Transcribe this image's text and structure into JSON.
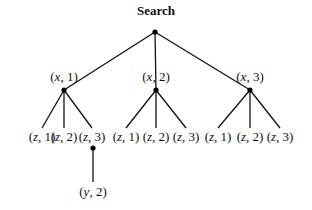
{
  "title": "Search",
  "colors": {
    "line": "#111111",
    "node": "#000000",
    "background": "#ffffff"
  },
  "nodes": {
    "root": {
      "label": "",
      "x": 155,
      "y": 32
    },
    "level1": [
      {
        "label": "(x, 1)",
        "var": "x",
        "val": "1",
        "x": 64,
        "y": 90,
        "labelY": 69
      },
      {
        "label": "(x, 2)",
        "var": "x",
        "val": "2",
        "x": 156,
        "y": 90,
        "labelY": 69
      },
      {
        "label": "(x, 3)",
        "var": "x",
        "val": "3",
        "x": 250,
        "y": 90,
        "labelY": 69
      }
    ],
    "level2": [
      {
        "label": "(z, 1)",
        "var": "z",
        "val": "1",
        "x": 42,
        "parent": 0
      },
      {
        "label": "(z, 2)",
        "var": "z",
        "val": "2",
        "x": 64,
        "parent": 0
      },
      {
        "label": "(z, 3)",
        "var": "z",
        "val": "3",
        "x": 92,
        "parent": 0
      },
      {
        "label": "(z, 1)",
        "var": "z",
        "val": "1",
        "x": 126,
        "parent": 1
      },
      {
        "label": "(z, 2)",
        "var": "z",
        "val": "2",
        "x": 156,
        "parent": 1
      },
      {
        "label": "(z, 3)",
        "var": "z",
        "val": "3",
        "x": 186,
        "parent": 1
      },
      {
        "label": "(z, 1)",
        "var": "z",
        "val": "1",
        "x": 218,
        "parent": 2
      },
      {
        "label": "(z, 2)",
        "var": "z",
        "val": "2",
        "x": 250,
        "parent": 2
      },
      {
        "label": "(z, 3)",
        "var": "z",
        "val": "3",
        "x": 280,
        "parent": 2
      }
    ],
    "level3": [
      {
        "label": "(y, 2)",
        "var": "y",
        "val": "2",
        "x": 93,
        "dotY": 148,
        "labelY": 184,
        "parent": 2
      }
    ]
  },
  "edges": [
    {
      "from": "root",
      "to": "level1.0"
    },
    {
      "from": "root",
      "to": "level1.1"
    },
    {
      "from": "root",
      "to": "level1.2"
    },
    {
      "from": "level1.0",
      "to": "level2.0"
    },
    {
      "from": "level1.0",
      "to": "level2.1"
    },
    {
      "from": "level1.0",
      "to": "level2.2"
    },
    {
      "from": "level1.1",
      "to": "level2.3"
    },
    {
      "from": "level1.1",
      "to": "level2.4"
    },
    {
      "from": "level1.1",
      "to": "level2.5"
    },
    {
      "from": "level1.2",
      "to": "level2.6"
    },
    {
      "from": "level1.2",
      "to": "level2.7"
    },
    {
      "from": "level1.2",
      "to": "level2.8"
    },
    {
      "from": "level2.2",
      "to": "level3.0"
    }
  ]
}
